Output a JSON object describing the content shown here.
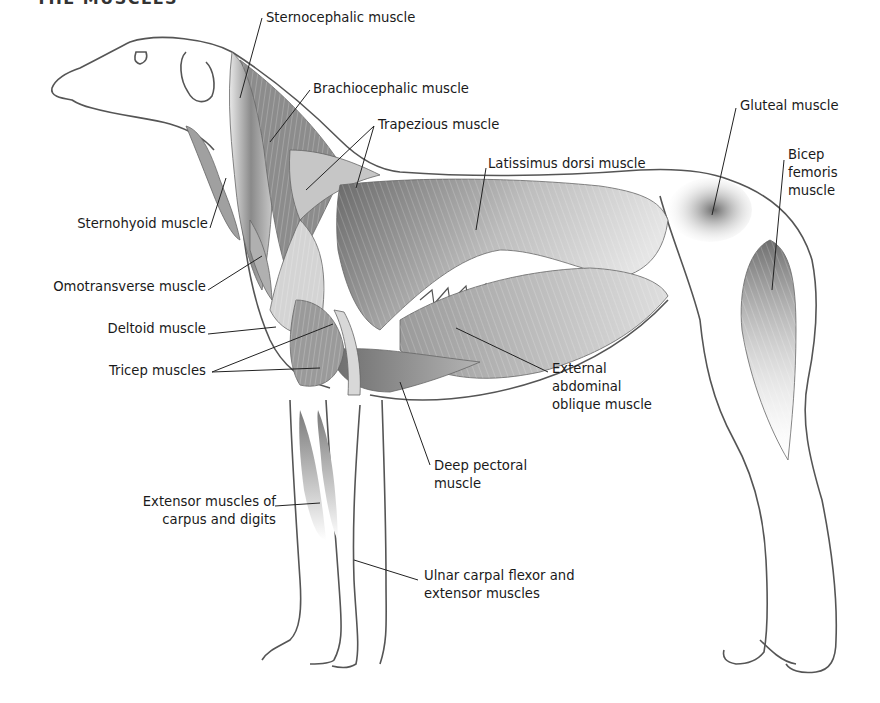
{
  "diagram": {
    "title": "The muscles",
    "colors": {
      "outline": "#555555",
      "muscle_dark": "#6e6e6e",
      "muscle_mid": "#a8a8a8",
      "muscle_light": "#e2e2e2",
      "leader_line": "#222222",
      "text": "#1a1a1a"
    },
    "labels": [
      {
        "id": "sternocephalic",
        "text": "Sternocephalic muscle"
      },
      {
        "id": "brachiocephalic",
        "text": "Brachiocephalic muscle"
      },
      {
        "id": "trapezious",
        "text": "Trapezious muscle"
      },
      {
        "id": "latissimus",
        "text": "Latissimus dorsi muscle"
      },
      {
        "id": "gluteal",
        "text": "Gluteal muscle"
      },
      {
        "id": "bicep_femoris",
        "text": "Bicep\nfemoris\nmuscle"
      },
      {
        "id": "sternohyoid",
        "text": "Sternohyoid muscle"
      },
      {
        "id": "omotransverse",
        "text": "Omotransverse muscle"
      },
      {
        "id": "deltoid",
        "text": "Deltoid muscle"
      },
      {
        "id": "tricep",
        "text": "Tricep muscles"
      },
      {
        "id": "ext_abd_oblique",
        "text": "External\nabdominal\noblique muscle"
      },
      {
        "id": "deep_pectoral",
        "text": "Deep pectoral\nmuscle"
      },
      {
        "id": "extensor_carpus",
        "text": "Extensor muscles of\ncarpus and digits"
      },
      {
        "id": "ulnar_carpal",
        "text": "Ulnar carpal flexor and\nextensor muscles"
      }
    ]
  }
}
